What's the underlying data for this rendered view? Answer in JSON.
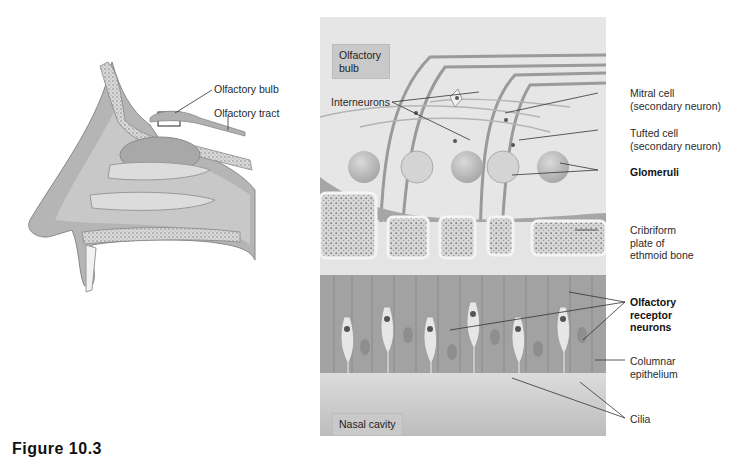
{
  "left_figure": {
    "title": "Sagittal section of nasal cavity",
    "labels": {
      "olfactory_bulb": "Olfactory bulb",
      "olfactory_tract": "Olfactory tract"
    }
  },
  "right_figure": {
    "region_tags": {
      "olfactory_bulb": "Olfactory\nbulb",
      "nasal_cavity": "Nasal cavity"
    },
    "labels": {
      "interneurons": "Interneurons",
      "mitral_cell_line1": "Mitral cell",
      "mitral_cell_line2": "(secondary neuron)",
      "tufted_cell_line1": "Tufted cell",
      "tufted_cell_line2": "(secondary neuron)",
      "glomeruli": "Glomeruli",
      "cribriform_line1": "Cribriform",
      "cribriform_line2": "plate of",
      "cribriform_line3": "ethmoid bone",
      "receptor_line1": "Olfactory",
      "receptor_line2": "receptor",
      "receptor_line3": "neurons",
      "columnar_line1": "Columnar",
      "columnar_line2": "epithelium",
      "cilia": "Cilia"
    }
  },
  "caption": {
    "text": "Figure 10.3"
  },
  "colors": {
    "panel_bg": "#e6e6e6",
    "tag_bg": "#c9c9c9",
    "tissue": "#b8b8b8",
    "bone": "#f2f2f2",
    "line": "#333333"
  }
}
